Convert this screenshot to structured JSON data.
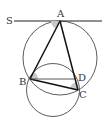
{
  "diagram": {
    "labels": {
      "S": "S",
      "A": "A",
      "B": "B",
      "C": "C",
      "D": "D"
    },
    "colors": {
      "stroke": "#222222",
      "angle_fill": "#c8c8c8",
      "background": "#ffffff"
    }
  }
}
